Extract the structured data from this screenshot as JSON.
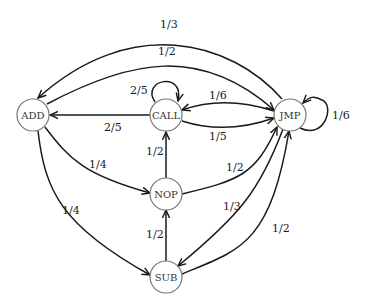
{
  "diagram": {
    "type": "state-transition-graph",
    "nodes": [
      {
        "id": "ADD",
        "label": "ADD"
      },
      {
        "id": "CALL",
        "label": "CALL"
      },
      {
        "id": "JMP",
        "label": "JMP"
      },
      {
        "id": "NOP",
        "label": "NOP"
      },
      {
        "id": "SUB",
        "label": "SUB"
      }
    ],
    "edges": [
      {
        "from": "JMP",
        "to": "ADD",
        "label": "1/3"
      },
      {
        "from": "ADD",
        "to": "JMP",
        "label": "1/2"
      },
      {
        "from": "CALL",
        "to": "CALL",
        "label": "2/5"
      },
      {
        "from": "CALL",
        "to": "ADD",
        "label": "2/5"
      },
      {
        "from": "JMP",
        "to": "CALL",
        "label": "1/6"
      },
      {
        "from": "CALL",
        "to": "JMP",
        "label": "1/5"
      },
      {
        "from": "JMP",
        "to": "JMP",
        "label": "1/6"
      },
      {
        "from": "ADD",
        "to": "NOP",
        "label": "1/4"
      },
      {
        "from": "ADD",
        "to": "SUB",
        "label": "1/4"
      },
      {
        "from": "NOP",
        "to": "CALL",
        "label": "1/2"
      },
      {
        "from": "SUB",
        "to": "NOP",
        "label": "1/2"
      },
      {
        "from": "NOP",
        "to": "JMP",
        "label": "1/2"
      },
      {
        "from": "JMP",
        "to": "SUB",
        "label": "1/3"
      },
      {
        "from": "SUB",
        "to": "JMP",
        "label": "1/2"
      }
    ]
  }
}
